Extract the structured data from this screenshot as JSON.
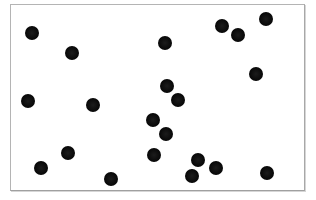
{
  "figure": {
    "type": "dot-array",
    "dot_count": 21,
    "dot_color": "#0a0a0a",
    "frame_color": "#b4b4b4",
    "background": "#ffffff",
    "dot_diameter_px": 14
  },
  "dots": [
    {
      "x": 32,
      "y": 33
    },
    {
      "x": 72,
      "y": 53
    },
    {
      "x": 165,
      "y": 43
    },
    {
      "x": 222,
      "y": 26
    },
    {
      "x": 238,
      "y": 35
    },
    {
      "x": 266,
      "y": 19
    },
    {
      "x": 256,
      "y": 74
    },
    {
      "x": 28,
      "y": 101
    },
    {
      "x": 93,
      "y": 105
    },
    {
      "x": 167,
      "y": 86
    },
    {
      "x": 178,
      "y": 100
    },
    {
      "x": 153,
      "y": 120
    },
    {
      "x": 166,
      "y": 134
    },
    {
      "x": 154,
      "y": 155
    },
    {
      "x": 68,
      "y": 153
    },
    {
      "x": 41,
      "y": 168
    },
    {
      "x": 111,
      "y": 179
    },
    {
      "x": 198,
      "y": 160
    },
    {
      "x": 216,
      "y": 168
    },
    {
      "x": 192,
      "y": 176
    },
    {
      "x": 267,
      "y": 173
    }
  ]
}
